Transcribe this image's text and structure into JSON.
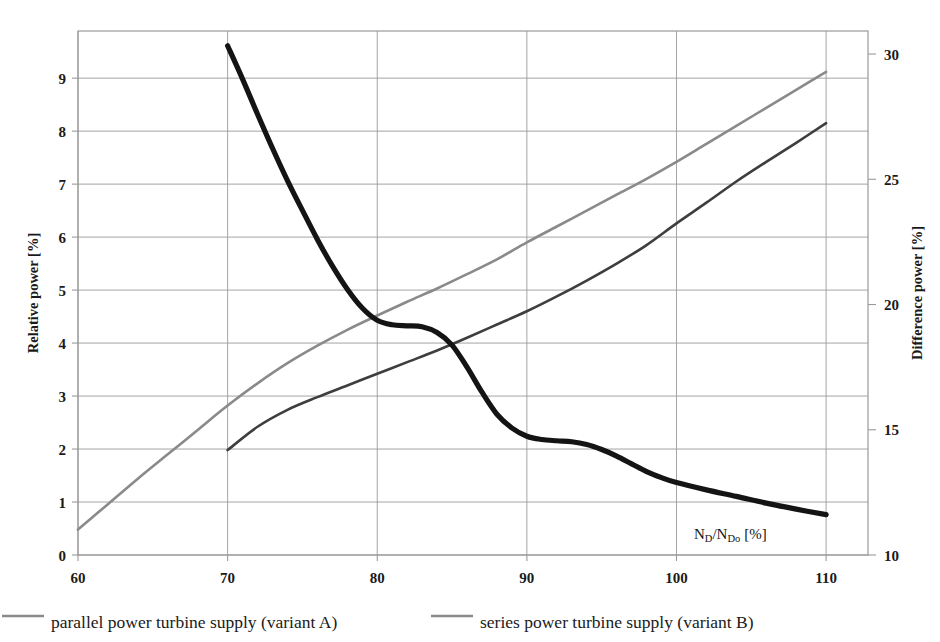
{
  "chart_data": {
    "type": "line",
    "title": "",
    "xlabel": "N_D/N_Do [%]",
    "xlabel_main": "N",
    "xlabel_sub1": "D",
    "xlabel_mid": "/N",
    "xlabel_sub2": "Do",
    "xlabel_unit": "[%]",
    "ylabel_left": "Relative power [%]",
    "ylabel_right": "Difference power [%]",
    "xlim": [
      60,
      112.8
    ],
    "xticks": [
      60,
      70,
      80,
      90,
      100,
      110
    ],
    "xticklabels": [
      "60",
      "70",
      "80",
      "90",
      "100",
      "110"
    ],
    "ylim_left": [
      0,
      9.89
    ],
    "yticks_left": [
      0,
      1,
      2,
      3,
      4,
      5,
      6,
      7,
      8,
      9
    ],
    "yticklabels_left": [
      "0",
      "1",
      "2",
      "3",
      "4",
      "5",
      "6",
      "7",
      "8",
      "9"
    ],
    "ylim_right": [
      10,
      30.92
    ],
    "yticks_right": [
      10,
      15,
      20,
      25,
      30
    ],
    "yticklabels_right": [
      "10",
      "15",
      "20",
      "25",
      "30"
    ],
    "grid": true,
    "legend_position": "below-plot",
    "series": [
      {
        "name": "parallel power turbine supply (variant A)",
        "axis": "left",
        "color": "#8a8a8a",
        "width": 2.6,
        "x": [
          60,
          62,
          64,
          66,
          68,
          70,
          72,
          74,
          76,
          78,
          80,
          82,
          84,
          86,
          88,
          90,
          92,
          94,
          96,
          98,
          100,
          102,
          104,
          106,
          108,
          110
        ],
        "y": [
          0.48,
          0.96,
          1.44,
          1.9,
          2.36,
          2.82,
          3.24,
          3.62,
          3.95,
          4.25,
          4.52,
          4.78,
          5.03,
          5.3,
          5.58,
          5.9,
          6.2,
          6.5,
          6.8,
          7.1,
          7.42,
          7.76,
          8.1,
          8.44,
          8.78,
          9.12
        ]
      },
      {
        "name": "series power turbine supply (variant B)",
        "axis": "left",
        "color": "#3e3e3e",
        "width": 2.6,
        "x": [
          70,
          72,
          74,
          76,
          78,
          80,
          82,
          84,
          86,
          88,
          90,
          92,
          94,
          96,
          98,
          100,
          102,
          104,
          106,
          108,
          110
        ],
        "y": [
          1.98,
          2.42,
          2.74,
          2.98,
          3.2,
          3.42,
          3.64,
          3.86,
          4.1,
          4.35,
          4.6,
          4.88,
          5.18,
          5.5,
          5.85,
          6.26,
          6.65,
          7.05,
          7.42,
          7.78,
          8.15
        ]
      },
      {
        "name": "difference power",
        "axis": "right",
        "color": "#141414",
        "width": 5.2,
        "x": [
          70,
          71,
          72,
          73,
          74,
          75,
          76,
          77,
          78,
          79,
          80,
          81,
          82,
          83,
          84,
          85,
          86,
          87,
          88,
          89,
          90,
          91,
          92,
          93,
          94,
          95,
          96,
          97,
          98,
          99,
          100,
          102,
          104,
          106,
          108,
          110
        ],
        "y_left_equiv": [
          8.85,
          8.25,
          7.62,
          7.0,
          6.42,
          5.88,
          5.36,
          4.88,
          4.46,
          4.12,
          3.9,
          3.82,
          3.8,
          3.78,
          3.68,
          3.45,
          3.05,
          2.6,
          2.2,
          1.95,
          1.8,
          1.74,
          1.72,
          1.7,
          1.65,
          1.56,
          1.44,
          1.3,
          1.16,
          1.04,
          0.95,
          0.82,
          0.7,
          0.58,
          0.47,
          0.37
        ],
        "y": [
          30.33,
          29.0,
          27.6,
          26.24,
          24.95,
          23.76,
          22.6,
          21.54,
          20.61,
          19.86,
          19.37,
          19.19,
          19.15,
          19.11,
          18.88,
          18.38,
          17.5,
          16.5,
          15.62,
          15.07,
          14.74,
          14.61,
          14.56,
          14.52,
          14.41,
          14.21,
          13.95,
          13.64,
          13.33,
          13.09,
          12.89,
          12.6,
          12.34,
          12.07,
          11.83,
          11.61
        ]
      }
    ],
    "annotation": "N_D/N_Do [%]"
  },
  "legend": {
    "entries": [
      {
        "label": "parallel power turbine supply (variant A)",
        "color": "#8a8a8a"
      },
      {
        "label": "series power turbine supply  (variant B)",
        "color": "#8a8a8a"
      }
    ]
  },
  "colors": {
    "frame": "#9a9a9a",
    "grid": "#9a9a9a",
    "variant_a": "#8a8a8a",
    "variant_b": "#3e3e3e",
    "difference": "#141414",
    "text": "#1a1a1a",
    "background": "#ffffff"
  }
}
